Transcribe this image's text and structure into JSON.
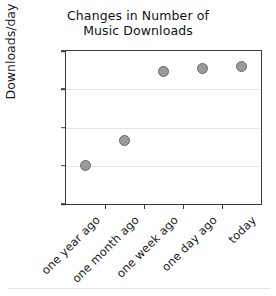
{
  "chart_data": {
    "type": "scatter",
    "title": "Changes in Number of Music Downloads",
    "title_lines": [
      "Changes in Number of",
      "Music Downloads"
    ],
    "xlabel": "",
    "ylabel": "Downloads/day",
    "categories": [
      "one year ago",
      "one month ago",
      "one week ago",
      "one day ago",
      "today"
    ],
    "values": [
      15,
      25,
      52,
      53,
      54
    ],
    "ylim": [
      0,
      60
    ],
    "yticks": [
      0,
      15,
      30,
      45,
      60
    ],
    "ytick_labels": [
      "0",
      "15",
      "30",
      "45",
      "60"
    ],
    "grid": true,
    "grid_axis": "y",
    "legend": false,
    "marker_color": "#9a9a9a",
    "marker_edge_color": "#6a6a6a",
    "gridline_color": "#e6e6e6",
    "frame_color": "#3a3a3a",
    "background_color": "#ffffff"
  }
}
